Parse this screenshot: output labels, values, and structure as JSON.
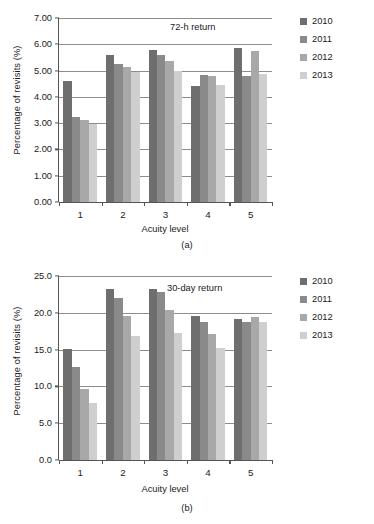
{
  "figure": {
    "series_colors": [
      "#6e6e6e",
      "#8a8a8a",
      "#a8a8a8",
      "#cfcfcf"
    ],
    "legend_labels": [
      "2010",
      "2011",
      "2012",
      "2013"
    ]
  },
  "chart_data": [
    {
      "id": "panel-a",
      "type": "bar",
      "title": "72-h return",
      "caption": "(a)",
      "xlabel": "Acuity level",
      "ylabel": "Percentage of revisits (%)",
      "categories": [
        "1",
        "2",
        "3",
        "4",
        "5"
      ],
      "ylim": [
        0,
        7
      ],
      "yticks": [
        0,
        1,
        2,
        3,
        4,
        5,
        6,
        7
      ],
      "ytick_labels": [
        "0.00",
        "1.00",
        "2.00",
        "3.00",
        "4.00",
        "5.00",
        "6.00",
        "7.00"
      ],
      "grid": true,
      "legend_position": "right",
      "series": [
        {
          "name": "2010",
          "values": [
            4.6,
            5.58,
            5.8,
            4.4,
            5.85
          ]
        },
        {
          "name": "2011",
          "values": [
            3.22,
            5.25,
            5.58,
            4.82,
            4.8
          ]
        },
        {
          "name": "2012",
          "values": [
            3.12,
            5.12,
            5.37,
            4.78,
            5.75
          ]
        },
        {
          "name": "2013",
          "values": [
            2.98,
            4.95,
            4.97,
            4.47,
            4.87
          ]
        }
      ]
    },
    {
      "id": "panel-b",
      "type": "bar",
      "title": "30-day return",
      "caption": "(b)",
      "xlabel": "Acuity level",
      "ylabel": "Percentage of revisits (%)",
      "categories": [
        "1",
        "2",
        "3",
        "4",
        "5"
      ],
      "ylim": [
        0,
        25
      ],
      "yticks": [
        0,
        5,
        10,
        15,
        20,
        25
      ],
      "ytick_labels": [
        "0.0",
        "5.0",
        "10.0",
        "15.0",
        "20.0",
        "25.0"
      ],
      "grid": true,
      "legend_position": "right",
      "series": [
        {
          "name": "2010",
          "values": [
            15.1,
            23.2,
            23.2,
            19.5,
            19.1
          ]
        },
        {
          "name": "2011",
          "values": [
            12.7,
            22.0,
            22.8,
            18.8,
            18.8
          ]
        },
        {
          "name": "2012",
          "values": [
            9.7,
            19.5,
            20.4,
            17.1,
            19.4
          ]
        },
        {
          "name": "2013",
          "values": [
            7.8,
            16.8,
            17.2,
            15.2,
            18.8
          ]
        }
      ]
    }
  ]
}
